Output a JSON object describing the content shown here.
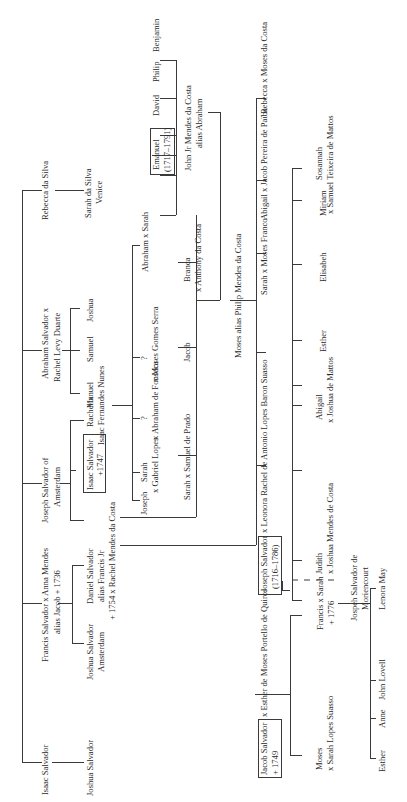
{
  "diagram": {
    "type": "family-tree",
    "orientation": "rotated-90-ccw",
    "generation_1": [
      {
        "id": "isaac",
        "lines": [
          "Isaac Salvador"
        ]
      },
      {
        "id": "francis",
        "lines": [
          "Francis Salvador x Anna Mendes",
          "alias Jacob + 1736"
        ]
      },
      {
        "id": "joseph_amsterdam",
        "lines": [
          "Joseph Salvador of",
          "Amsterdam"
        ]
      },
      {
        "id": "abraham",
        "lines": [
          "Abraham Salvador x",
          "Rachel Levy Duarte"
        ]
      },
      {
        "id": "rebecca_silva",
        "lines": [
          "Rebecca da Silva"
        ]
      }
    ],
    "generation_2": [
      {
        "id": "joshua1",
        "lines": [
          "Joshua Salvador"
        ]
      },
      {
        "id": "joshua2",
        "lines": [
          "Joshua Salvador",
          "Amsterdam"
        ]
      },
      {
        "id": "daniel",
        "lines": [
          "Daniel Salvador",
          "alias Francis Jr",
          "+ 1754 x Rachel Mendes da Costa"
        ]
      },
      {
        "id": "isaac_boxed",
        "lines": [
          "Isaac Salvador",
          "+1747"
        ],
        "boxed": true
      },
      {
        "id": "rachel",
        "lines": [
          "Rachel x",
          "Isaac Fernandes Nunes"
        ]
      },
      {
        "id": "manuel",
        "lines": [
          "Manuel"
        ]
      },
      {
        "id": "samuel",
        "lines": [
          "Samuel"
        ]
      },
      {
        "id": "joshua3",
        "lines": [
          "Joshua"
        ]
      },
      {
        "id": "sarah_silva",
        "lines": [
          "Sarah da Silva",
          "Venice"
        ]
      }
    ],
    "generation_3": [
      {
        "id": "joseph",
        "lines": [
          "Joseph"
        ]
      },
      {
        "id": "sarah_lopes",
        "lines": [
          "Sarah",
          "x Gabriel Lopes"
        ]
      },
      {
        "id": "q1",
        "lines": [
          "?",
          "x Abraham de Fonseca"
        ]
      },
      {
        "id": "q2",
        "lines": [
          "?",
          "x Moses Gomes Serra"
        ]
      },
      {
        "id": "abraham_sarah",
        "lines": [
          "Abraham x Sarah"
        ]
      },
      {
        "id": "emanuel",
        "lines": [
          "Emanuel",
          "(1717–1791)"
        ],
        "boxed": true
      },
      {
        "id": "david",
        "lines": [
          "David"
        ]
      },
      {
        "id": "philip",
        "lines": [
          "Philip"
        ]
      },
      {
        "id": "benjamin",
        "lines": [
          "Benjamin"
        ]
      },
      {
        "id": "john_jr",
        "lines": [
          "John Jr Mendes da Costa",
          "alias Abraham"
        ]
      },
      {
        "id": "sarah_prado",
        "lines": [
          "Sarah x Samuel de Prado"
        ]
      },
      {
        "id": "jacob",
        "lines": [
          "Jacob"
        ]
      },
      {
        "id": "branca",
        "lines": [
          "Branca",
          "x Anthony da Costa"
        ]
      },
      {
        "id": "moses_philip",
        "lines": [
          "Moses alias Philip Mendes da Costa"
        ]
      }
    ],
    "generation_4": [
      {
        "id": "jacob_salvador",
        "lines": [
          "Jacob Salvador",
          "+ 1749"
        ],
        "boxed": true
      },
      {
        "id": "esther_quiros",
        "lines": [
          "x Esther de Moses Portello de Quiros"
        ]
      },
      {
        "id": "joseph_salvador_boxed",
        "lines": [
          "Joseph Salvador",
          "(1716–1786)"
        ],
        "boxed": true
      },
      {
        "id": "leonora",
        "lines": [
          "x Leonora Rachel de Antonio Lopes Baron Suasso"
        ]
      },
      {
        "id": "sarah_franco",
        "lines": [
          "Sarah x Moses Franco"
        ]
      },
      {
        "id": "abigail_paiba",
        "lines": [
          "Abigail x Jacob Pereira de Païba"
        ]
      },
      {
        "id": "rebecca_costa",
        "lines": [
          "Rebecca x Moses da Costa"
        ]
      }
    ],
    "generation_5": [
      {
        "id": "moses",
        "lines": [
          "Moses",
          "x Sarah Lopes Suasso"
        ]
      },
      {
        "id": "francis_sarah",
        "lines": [
          "Francis x Sarah",
          "+ 1776"
        ]
      },
      {
        "id": "judith",
        "lines": [
          "Judith",
          "x Joshua Mendes de Costa"
        ]
      },
      {
        "id": "abigail_mattos",
        "lines": [
          "Abigail",
          "x Joshua de Mattos"
        ]
      },
      {
        "id": "esther",
        "lines": [
          "Esther"
        ]
      },
      {
        "id": "elisabeh",
        "lines": [
          "Elisabeh"
        ]
      },
      {
        "id": "miriam",
        "lines": [
          "Miriam"
        ]
      },
      {
        "id": "sosannah",
        "lines": [
          "Sosannah",
          "x Samuel Teixeira de Mattos"
        ]
      }
    ],
    "generation_6": [
      {
        "id": "jospeh_moriencourt",
        "lines": [
          "Jospeh Salvador de",
          "Moriencourt"
        ]
      }
    ],
    "generation_7": [
      {
        "id": "esther2",
        "lines": [
          "Esther"
        ]
      },
      {
        "id": "anne",
        "lines": [
          "Anne"
        ]
      },
      {
        "id": "john_lovell",
        "lines": [
          "John Lovell"
        ]
      },
      {
        "id": "lenora_may",
        "lines": [
          "Lenora May"
        ]
      }
    ]
  }
}
